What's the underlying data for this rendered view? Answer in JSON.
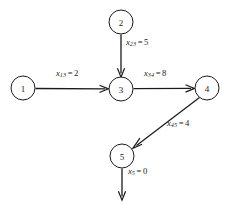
{
  "diagram": {
    "type": "flow-network",
    "title": "",
    "background_color": "#ffffff",
    "stroke_color": "#1a1a1a",
    "nodes": [
      {
        "id": "1",
        "label": "1",
        "cx": 23,
        "cy": 88,
        "r": 12
      },
      {
        "id": "2",
        "label": "2",
        "cx": 121,
        "cy": 22,
        "r": 12
      },
      {
        "id": "3",
        "label": "3",
        "cx": 121,
        "cy": 89,
        "r": 12
      },
      {
        "id": "4",
        "label": "4",
        "cx": 207,
        "cy": 88,
        "r": 12
      },
      {
        "id": "5",
        "label": "5",
        "cx": 122,
        "cy": 156,
        "r": 12
      }
    ],
    "edges": [
      {
        "id": "e13",
        "from": "1",
        "to": "3",
        "variable": "x",
        "subscript": "13",
        "equals": "=",
        "value": "2",
        "label_text": "x13 = 2",
        "label_x": 56,
        "label_y": 74
      },
      {
        "id": "e23",
        "from": "2",
        "to": "3",
        "variable": "x",
        "subscript": "23",
        "equals": "=",
        "value": "5",
        "label_text": "x23 = 5",
        "label_x": 126,
        "label_y": 43
      },
      {
        "id": "e34",
        "from": "3",
        "to": "4",
        "variable": "x",
        "subscript": "34",
        "equals": "=",
        "value": "8",
        "label_text": "x34 = 8",
        "label_x": 144,
        "label_y": 74
      },
      {
        "id": "e45",
        "from": "4",
        "to": "5",
        "variable": "x",
        "subscript": "45",
        "equals": "=",
        "value": "4",
        "label_text": "x45 = 4",
        "label_x": 167,
        "label_y": 124
      },
      {
        "id": "e5out",
        "from": "5",
        "to": "sink",
        "variable": "x",
        "subscript": "5",
        "equals": "=",
        "value": "0",
        "label_text": "x5 = 0",
        "label_x": 128,
        "label_y": 172
      }
    ]
  }
}
